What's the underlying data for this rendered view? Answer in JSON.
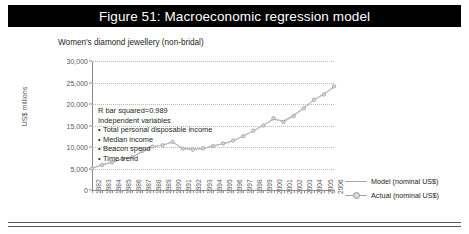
{
  "figure": {
    "title": "Figure 51: Macroeconomic regression model",
    "subtitle": "Women's diamond jewellery (non-bridal)"
  },
  "annotation": {
    "r_squared": "R bar squared=0.989",
    "heading": "Independent variables",
    "variables": [
      "Total personal disposable income",
      "Median income",
      "Beacon spend",
      "Time trend"
    ]
  },
  "colors": {
    "title_bar": "#000000",
    "title_text": "#ffffff",
    "model_line": "#a7a9ac",
    "actual_line": "#bcbec0",
    "actual_marker": "#d9dadb",
    "gridline": "#b9b9b9",
    "axis": "#8c8c8c",
    "text": "#231f20",
    "tick_text": "#58585a"
  },
  "chart_data": {
    "type": "line",
    "title": "Figure 51: Macroeconomic regression model",
    "subtitle": "Women's diamond jewellery (non-bridal)",
    "xlabel": "",
    "ylabel": "US$ millions",
    "ylim": [
      0,
      30000
    ],
    "yticks": [
      0,
      5000,
      10000,
      15000,
      20000,
      25000,
      30000
    ],
    "ytick_labels": [
      "0",
      "5,000",
      "10,000",
      "15,000",
      "20,000",
      "25,000",
      "30,000"
    ],
    "grid": true,
    "legend_position": "right",
    "categories": [
      "1982",
      "1983",
      "1984",
      "1985",
      "1986",
      "1987",
      "1988",
      "1989",
      "1990",
      "1991",
      "1992",
      "1993",
      "1994",
      "1995",
      "1996",
      "1997",
      "1998",
      "1999",
      "2000",
      "2001",
      "2002",
      "2003",
      "2004",
      "2005",
      "2006"
    ],
    "series": [
      {
        "name": "Model (nominal US$)",
        "values": [
          5100,
          5900,
          6500,
          7300,
          7600,
          8900,
          10000,
          10500,
          11100,
          9700,
          9500,
          9600,
          10300,
          10700,
          11400,
          12600,
          13700,
          15100,
          16400,
          16100,
          17400,
          19100,
          20900,
          22400,
          23900
        ]
      },
      {
        "name": "Actual (nominal US$)",
        "values": [
          5000,
          5800,
          6400,
          7200,
          7700,
          9100,
          10100,
          10400,
          11200,
          9600,
          9400,
          9700,
          10200,
          10800,
          11500,
          12500,
          13800,
          15000,
          16700,
          15800,
          17200,
          19000,
          21000,
          22200,
          24100
        ]
      }
    ]
  },
  "legend": [
    {
      "label": "Model (nominal US$)",
      "marker": false
    },
    {
      "label": "Actual (nominal US$)",
      "marker": true
    }
  ]
}
